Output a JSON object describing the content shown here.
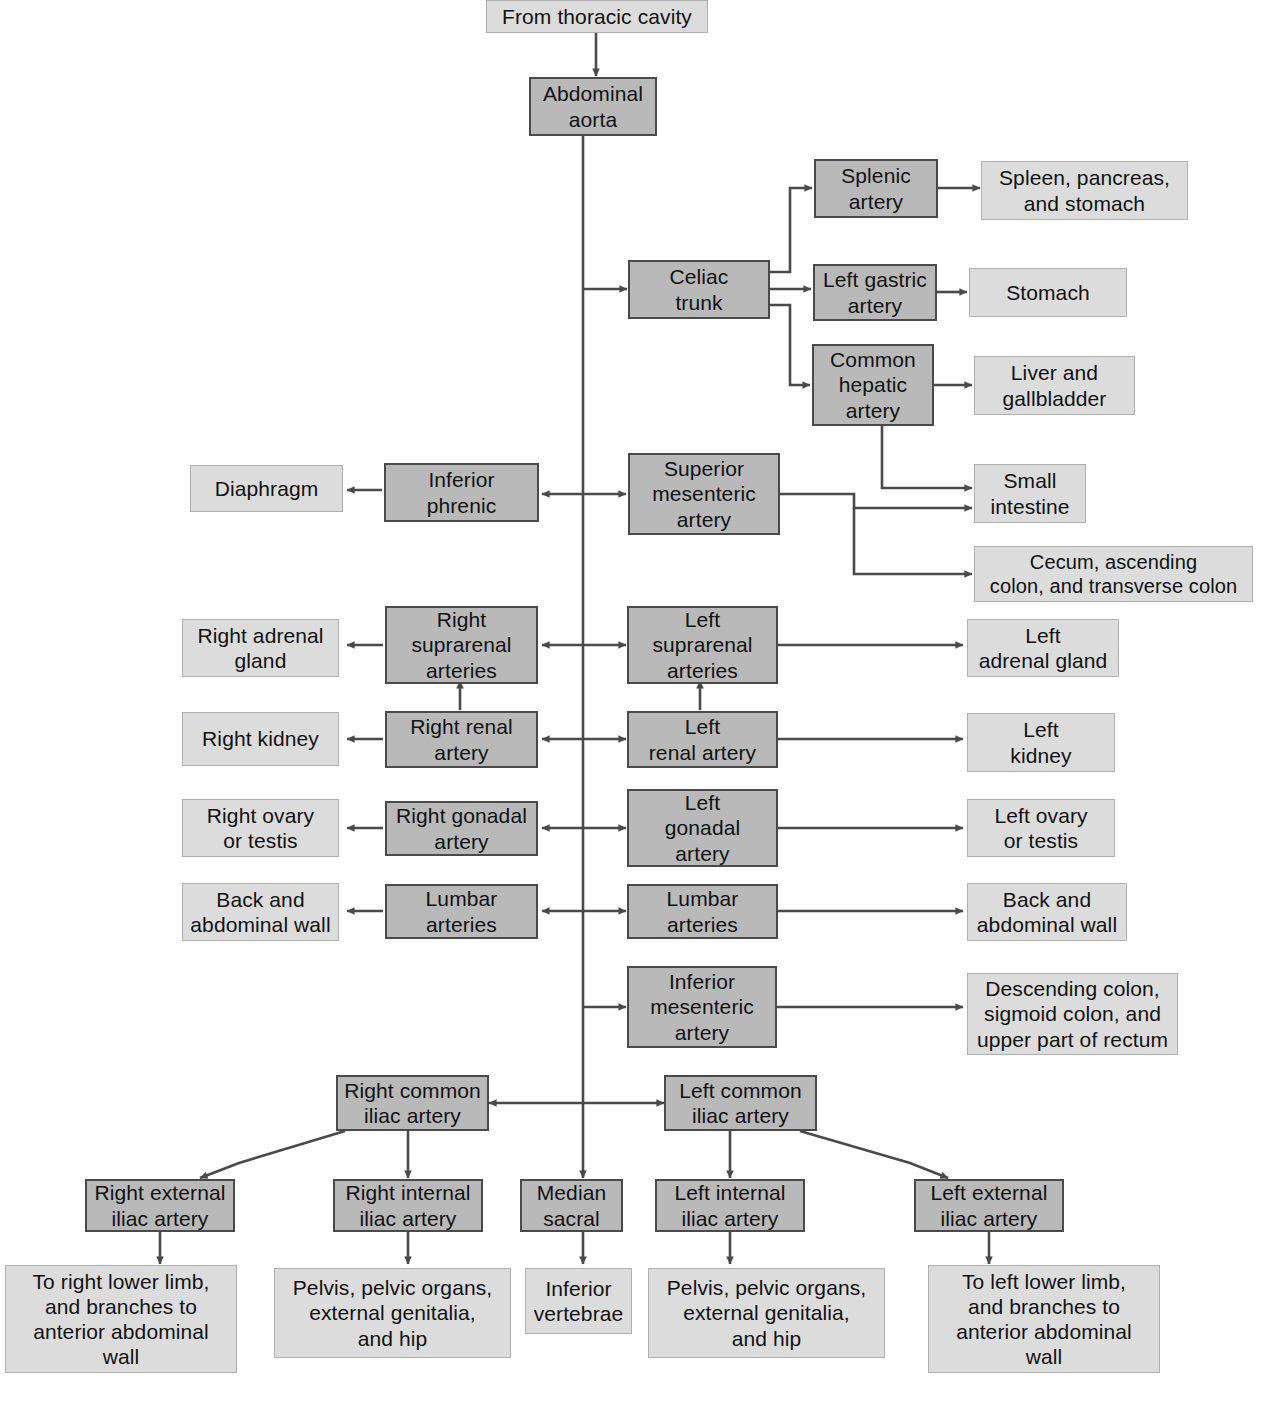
{
  "diagram": {
    "colors": {
      "vessel_fill": "#b9b9b9",
      "vessel_border": "#4a4a4a",
      "organ_fill": "#dcdcdc",
      "organ_border": "#b0b0b0",
      "connector": "#4a4a4a",
      "background": "#ffffff"
    },
    "nodes": {
      "from_thoracic_cavity": "From thoracic cavity",
      "abdominal_aorta": "Abdominal\naorta",
      "celiac_trunk": "Celiac\ntrunk",
      "splenic_artery": "Splenic\nartery",
      "spleen_pancreas_stomach": "Spleen, pancreas,\nand stomach",
      "left_gastric_artery": "Left gastric\nartery",
      "stomach": "Stomach",
      "common_hepatic_artery": "Common\nhepatic\nartery",
      "liver_and_gallbladder": "Liver and\ngallbladder",
      "diaphragm": "Diaphragm",
      "inferior_phrenic": "Inferior\nphrenic",
      "superior_mesenteric_artery": "Superior\nmesenteric\nartery",
      "small_intestine": "Small\nintestine",
      "cecum_ascending_transverse": "Cecum, ascending\ncolon, and transverse colon",
      "right_adrenal_gland": "Right adrenal\ngland",
      "right_suprarenal_arteries": "Right\nsuprarenal\narteries",
      "left_suprarenal_arteries": "Left\nsuprarenal\narteries",
      "left_adrenal_gland": "Left\nadrenal gland",
      "right_kidney": "Right kidney",
      "right_renal_artery": "Right renal\nartery",
      "left_renal_artery": "Left\nrenal artery",
      "left_kidney": "Left\nkidney",
      "right_ovary_or_testis": "Right ovary\nor testis",
      "right_gonadal_artery": "Right gonadal\nartery",
      "left_gonadal_artery": "Left\ngonadal\nartery",
      "left_ovary_or_testis": "Left ovary\nor testis",
      "back_and_abdominal_wall_left": "Back and\nabdominal wall",
      "lumbar_arteries_right": "Lumbar\narteries",
      "lumbar_arteries_left": "Lumbar\narteries",
      "back_and_abdominal_wall_right": "Back and\nabdominal wall",
      "inferior_mesenteric_artery": "Inferior\nmesenteric\nartery",
      "descending_sigmoid_rectum": "Descending colon,\nsigmoid colon, and\nupper part of rectum",
      "right_common_iliac_artery": "Right common\niliac artery",
      "left_common_iliac_artery": "Left common\niliac artery",
      "right_external_iliac_artery": "Right external\niliac artery",
      "right_internal_iliac_artery": "Right internal\niliac artery",
      "median_sacral": "Median\nsacral",
      "left_internal_iliac_artery": "Left internal\niliac artery",
      "left_external_iliac_artery": "Left external\niliac artery",
      "to_right_lower_limb": "To right lower limb,\nand branches to\nanterior abdominal\nwall",
      "pelvis_right": "Pelvis, pelvic organs,\nexternal genitalia,\nand hip",
      "inferior_vertebrae": "Inferior\nvertebrae",
      "pelvis_left": "Pelvis, pelvic organs,\nexternal genitalia,\nand hip",
      "to_left_lower_limb": "To left lower limb,\nand branches to\nanterior abdominal\nwall"
    }
  }
}
